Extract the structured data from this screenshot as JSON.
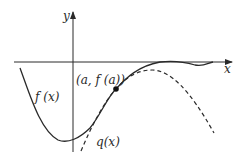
{
  "diagram": {
    "title": "",
    "axes": {
      "x_label": "x",
      "y_label": "y"
    },
    "curves": [
      {
        "name": "f",
        "label": "f (x)",
        "style": "solid"
      },
      {
        "name": "q",
        "label": "q(x)",
        "style": "dashed"
      }
    ],
    "point": {
      "label": "(a, f (a))"
    },
    "colors": {
      "ink": "#2a2a2a",
      "background": "#ffffff"
    }
  }
}
